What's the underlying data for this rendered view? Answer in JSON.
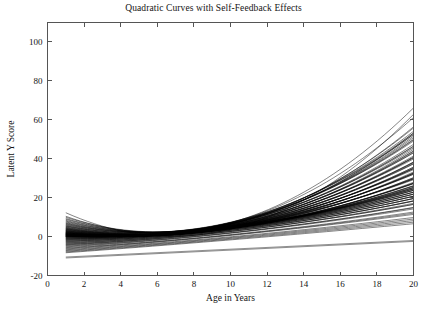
{
  "chart_data": {
    "type": "line",
    "title": "Quadratic Curves with Self-Feedback Effects",
    "xlabel": "Age in Years",
    "ylabel": "Latent Y Score",
    "xlim": [
      0,
      20
    ],
    "ylim": [
      -20,
      110
    ],
    "xticks": [
      0,
      2,
      4,
      6,
      8,
      10,
      12,
      14,
      16,
      18,
      20
    ],
    "xtick_labels": [
      "0",
      "2",
      "4",
      "6",
      "8",
      "10",
      "12",
      "14",
      "16",
      "18",
      "20"
    ],
    "yticks": [
      -20,
      0,
      20,
      40,
      60,
      80,
      100
    ],
    "ytick_labels": [
      "-20",
      "0",
      "20",
      "40",
      "60",
      "80",
      "100"
    ],
    "grid": false,
    "legend": false,
    "legend_position": "none",
    "line_color": "#000000",
    "background_color": "#ffffff",
    "axis_color": "#555555",
    "x_domain_of_data": [
      1,
      20
    ],
    "n_series": 100,
    "series_description": "Approximately 100 individual quadratic growth trajectories y = a + b*age + c*age^2, densely overlapping near age 1-6 and fanning outward after age 8",
    "series_value_summary": {
      "at_age_1": {
        "min": -11,
        "max": 17,
        "typical": 3
      },
      "at_age_4": {
        "min": -11,
        "max": 8,
        "typical": 0
      },
      "at_age_8": {
        "min": -8,
        "max": 12,
        "typical": 2
      },
      "at_age_12": {
        "min": -6,
        "max": 30,
        "typical": 12
      },
      "at_age_16": {
        "min": -4,
        "max": 48,
        "typical": 22
      },
      "at_age_20": {
        "min": -2,
        "max": 70,
        "typical": 33
      }
    },
    "vertex_age_range": [
      3.5,
      5.5
    ],
    "outlier_series": [
      {
        "name": "low-flat-1",
        "points": [
          [
            1,
            -10.5
          ],
          [
            20,
            -2.0
          ]
        ]
      },
      {
        "name": "low-flat-2",
        "points": [
          [
            1,
            -11.0
          ],
          [
            20,
            -2.5
          ]
        ]
      }
    ],
    "series": [
      {
        "name": "curve-1",
        "a": 16.8,
        "b": -4.9,
        "c": 0.36
      },
      {
        "name": "curve-2",
        "a": 14.1,
        "b": -4.0,
        "c": 0.33
      },
      {
        "name": "curve-3",
        "a": 13.2,
        "b": -3.6,
        "c": 0.3
      },
      {
        "name": "curve-4",
        "a": 12.4,
        "b": -3.4,
        "c": 0.28
      },
      {
        "name": "curve-5",
        "a": 11.8,
        "b": -3.2,
        "c": 0.27
      },
      {
        "name": "curve-6",
        "a": 11.2,
        "b": -3.1,
        "c": 0.26
      },
      {
        "name": "curve-7",
        "a": 10.6,
        "b": -2.9,
        "c": 0.25
      },
      {
        "name": "curve-8",
        "a": 10.1,
        "b": -2.8,
        "c": 0.25
      },
      {
        "name": "curve-9",
        "a": 9.6,
        "b": -2.7,
        "c": 0.24
      },
      {
        "name": "curve-10",
        "a": 9.2,
        "b": -2.6,
        "c": 0.24
      },
      {
        "name": "curve-11",
        "a": 8.8,
        "b": -2.5,
        "c": 0.23
      },
      {
        "name": "curve-12",
        "a": 8.4,
        "b": -2.4,
        "c": 0.23
      },
      {
        "name": "curve-13",
        "a": 8.0,
        "b": -2.3,
        "c": 0.22
      },
      {
        "name": "curve-14",
        "a": 7.7,
        "b": -2.3,
        "c": 0.22
      },
      {
        "name": "curve-15",
        "a": 7.4,
        "b": -2.2,
        "c": 0.21
      },
      {
        "name": "curve-16",
        "a": 7.1,
        "b": -2.1,
        "c": 0.21
      },
      {
        "name": "curve-17",
        "a": 6.8,
        "b": -2.1,
        "c": 0.2
      },
      {
        "name": "curve-18",
        "a": 6.5,
        "b": -2.0,
        "c": 0.2
      },
      {
        "name": "curve-19",
        "a": 6.3,
        "b": -2.0,
        "c": 0.2
      },
      {
        "name": "curve-20",
        "a": 6.0,
        "b": -1.9,
        "c": 0.19
      },
      {
        "name": "curve-21",
        "a": 5.8,
        "b": -1.9,
        "c": 0.19
      },
      {
        "name": "curve-22",
        "a": 5.6,
        "b": -1.8,
        "c": 0.19
      },
      {
        "name": "curve-23",
        "a": 5.4,
        "b": -1.8,
        "c": 0.18
      },
      {
        "name": "curve-24",
        "a": 5.2,
        "b": -1.7,
        "c": 0.18
      },
      {
        "name": "curve-25",
        "a": 5.0,
        "b": -1.7,
        "c": 0.18
      },
      {
        "name": "curve-26",
        "a": 4.8,
        "b": -1.6,
        "c": 0.17
      },
      {
        "name": "curve-27",
        "a": 4.6,
        "b": -1.6,
        "c": 0.17
      },
      {
        "name": "curve-28",
        "a": 4.5,
        "b": -1.6,
        "c": 0.17
      },
      {
        "name": "curve-29",
        "a": 4.3,
        "b": -1.5,
        "c": 0.16
      },
      {
        "name": "curve-30",
        "a": 4.2,
        "b": -1.5,
        "c": 0.16
      },
      {
        "name": "curve-31",
        "a": 4.0,
        "b": -1.5,
        "c": 0.16
      },
      {
        "name": "curve-32",
        "a": 3.9,
        "b": -1.4,
        "c": 0.16
      },
      {
        "name": "curve-33",
        "a": 3.7,
        "b": -1.4,
        "c": 0.15
      },
      {
        "name": "curve-34",
        "a": 3.6,
        "b": -1.4,
        "c": 0.15
      },
      {
        "name": "curve-35",
        "a": 3.5,
        "b": -1.3,
        "c": 0.15
      },
      {
        "name": "curve-36",
        "a": 3.3,
        "b": -1.3,
        "c": 0.15
      },
      {
        "name": "curve-37",
        "a": 3.2,
        "b": -1.3,
        "c": 0.14
      },
      {
        "name": "curve-38",
        "a": 3.1,
        "b": -1.2,
        "c": 0.14
      },
      {
        "name": "curve-39",
        "a": 3.0,
        "b": -1.2,
        "c": 0.14
      },
      {
        "name": "curve-40",
        "a": 2.9,
        "b": -1.2,
        "c": 0.14
      },
      {
        "name": "curve-41",
        "a": 2.7,
        "b": -1.1,
        "c": 0.13
      },
      {
        "name": "curve-42",
        "a": 2.6,
        "b": -1.1,
        "c": 0.13
      },
      {
        "name": "curve-43",
        "a": 2.5,
        "b": -1.1,
        "c": 0.13
      },
      {
        "name": "curve-44",
        "a": 2.4,
        "b": -1.0,
        "c": 0.13
      },
      {
        "name": "curve-45",
        "a": 2.3,
        "b": -1.0,
        "c": 0.12
      },
      {
        "name": "curve-46",
        "a": 2.2,
        "b": -1.0,
        "c": 0.12
      },
      {
        "name": "curve-47",
        "a": 2.1,
        "b": -0.9,
        "c": 0.12
      },
      {
        "name": "curve-48",
        "a": 2.0,
        "b": -0.9,
        "c": 0.12
      },
      {
        "name": "curve-49",
        "a": 1.9,
        "b": -0.9,
        "c": 0.11
      },
      {
        "name": "curve-50",
        "a": 1.8,
        "b": -0.8,
        "c": 0.11
      },
      {
        "name": "curve-51",
        "a": 1.7,
        "b": -0.8,
        "c": 0.11
      },
      {
        "name": "curve-52",
        "a": 1.6,
        "b": -0.8,
        "c": 0.11
      },
      {
        "name": "curve-53",
        "a": 1.5,
        "b": -0.7,
        "c": 0.1
      },
      {
        "name": "curve-54",
        "a": 1.4,
        "b": -0.7,
        "c": 0.1
      },
      {
        "name": "curve-55",
        "a": 1.3,
        "b": -0.7,
        "c": 0.1
      },
      {
        "name": "curve-56",
        "a": 1.2,
        "b": -0.6,
        "c": 0.1
      },
      {
        "name": "curve-57",
        "a": 1.1,
        "b": -0.6,
        "c": 0.095
      },
      {
        "name": "curve-58",
        "a": 1.0,
        "b": -0.6,
        "c": 0.093
      },
      {
        "name": "curve-59",
        "a": 0.9,
        "b": -0.55,
        "c": 0.09
      },
      {
        "name": "curve-60",
        "a": 0.8,
        "b": -0.5,
        "c": 0.088
      },
      {
        "name": "curve-61",
        "a": 0.7,
        "b": -0.5,
        "c": 0.086
      },
      {
        "name": "curve-62",
        "a": 0.6,
        "b": -0.45,
        "c": 0.084
      },
      {
        "name": "curve-63",
        "a": 0.5,
        "b": -0.4,
        "c": 0.082
      },
      {
        "name": "curve-64",
        "a": 0.4,
        "b": -0.4,
        "c": 0.08
      },
      {
        "name": "curve-65",
        "a": 0.3,
        "b": -0.35,
        "c": 0.078
      },
      {
        "name": "curve-66",
        "a": 0.2,
        "b": -0.3,
        "c": 0.076
      },
      {
        "name": "curve-67",
        "a": 0.1,
        "b": -0.3,
        "c": 0.074
      },
      {
        "name": "curve-68",
        "a": 0.0,
        "b": -0.25,
        "c": 0.072
      },
      {
        "name": "curve-69",
        "a": -0.2,
        "b": -0.2,
        "c": 0.07
      },
      {
        "name": "curve-70",
        "a": -0.4,
        "b": -0.2,
        "c": 0.068
      },
      {
        "name": "curve-71",
        "a": -0.6,
        "b": -0.15,
        "c": 0.066
      },
      {
        "name": "curve-72",
        "a": -0.8,
        "b": -0.1,
        "c": 0.064
      },
      {
        "name": "curve-73",
        "a": -1.0,
        "b": -0.1,
        "c": 0.062
      },
      {
        "name": "curve-74",
        "a": -1.2,
        "b": -0.05,
        "c": 0.06
      },
      {
        "name": "curve-75",
        "a": -1.4,
        "b": 0.0,
        "c": 0.058
      },
      {
        "name": "curve-76",
        "a": -1.6,
        "b": 0.0,
        "c": 0.056
      },
      {
        "name": "curve-77",
        "a": -1.9,
        "b": 0.05,
        "c": 0.054
      },
      {
        "name": "curve-78",
        "a": -2.1,
        "b": 0.1,
        "c": 0.052
      },
      {
        "name": "curve-79",
        "a": -2.4,
        "b": 0.1,
        "c": 0.05
      },
      {
        "name": "curve-80",
        "a": -2.6,
        "b": 0.15,
        "c": 0.048
      },
      {
        "name": "curve-81",
        "a": -2.9,
        "b": 0.2,
        "c": 0.046
      },
      {
        "name": "curve-82",
        "a": -3.2,
        "b": 0.2,
        "c": 0.044
      },
      {
        "name": "curve-83",
        "a": -3.5,
        "b": 0.25,
        "c": 0.042
      },
      {
        "name": "curve-84",
        "a": -3.8,
        "b": 0.3,
        "c": 0.04
      },
      {
        "name": "curve-85",
        "a": -4.1,
        "b": 0.3,
        "c": 0.038
      },
      {
        "name": "curve-86",
        "a": -4.4,
        "b": 0.35,
        "c": 0.035
      },
      {
        "name": "curve-87",
        "a": -4.7,
        "b": 0.4,
        "c": 0.033
      },
      {
        "name": "curve-88",
        "a": -5.0,
        "b": 0.4,
        "c": 0.03
      },
      {
        "name": "curve-89",
        "a": -5.4,
        "b": 0.45,
        "c": 0.028
      },
      {
        "name": "curve-90",
        "a": -5.8,
        "b": 0.5,
        "c": 0.025
      },
      {
        "name": "curve-91",
        "a": -6.2,
        "b": 0.5,
        "c": 0.022
      },
      {
        "name": "curve-92",
        "a": -6.6,
        "b": 0.55,
        "c": 0.019
      },
      {
        "name": "curve-93",
        "a": -7.0,
        "b": 0.6,
        "c": 0.016
      },
      {
        "name": "curve-94",
        "a": -7.4,
        "b": 0.6,
        "c": 0.013
      },
      {
        "name": "curve-95",
        "a": -7.8,
        "b": 0.62,
        "c": 0.011
      },
      {
        "name": "curve-96",
        "a": -8.2,
        "b": 0.64,
        "c": 0.009
      },
      {
        "name": "curve-97",
        "a": -8.6,
        "b": 0.66,
        "c": 0.007
      },
      {
        "name": "curve-98",
        "a": -9.0,
        "b": 0.68,
        "c": 0.005
      }
    ]
  }
}
